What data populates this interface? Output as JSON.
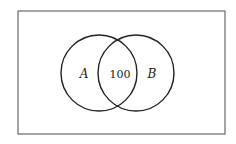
{
  "diagram": {
    "type": "venn",
    "universe": {
      "label": ""
    },
    "sets": [
      {
        "id": "A",
        "label": "A"
      },
      {
        "id": "B",
        "label": "B"
      }
    ],
    "regions": {
      "intersection": {
        "sets": [
          "A",
          "B"
        ],
        "value": "100"
      }
    },
    "colors": {
      "stroke": "#222222",
      "frame": "#6a6a6a",
      "background": "#ffffff"
    }
  }
}
